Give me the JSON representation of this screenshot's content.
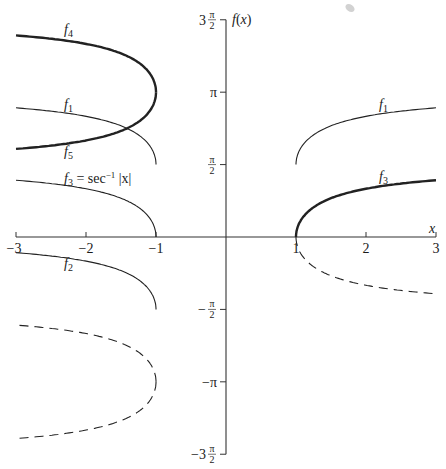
{
  "chart_data": {
    "type": "line",
    "title": "",
    "xlabel": "x",
    "ylabel": "f(x)",
    "xlim": [
      -3,
      3
    ],
    "ylim": [
      -4.712,
      4.712
    ],
    "grid": false,
    "x_ticks": [
      {
        "value": -3,
        "label": "−3"
      },
      {
        "value": -2,
        "label": "−2"
      },
      {
        "value": -1,
        "label": "−1"
      },
      {
        "value": 1,
        "label": "1"
      },
      {
        "value": 2,
        "label": "2"
      },
      {
        "value": 3,
        "label": "3"
      }
    ],
    "y_ticks": [
      {
        "value": 4.712,
        "label_pre": "3",
        "label_num": "π",
        "label_den": "2",
        "frac": true
      },
      {
        "value": 3.1416,
        "label_pre": "",
        "label_num": "π",
        "label_den": "",
        "frac": false
      },
      {
        "value": 1.5708,
        "label_pre": "",
        "label_num": "π",
        "label_den": "2",
        "frac": true
      },
      {
        "value": -1.5708,
        "label_pre": "−",
        "label_num": "π",
        "label_den": "2",
        "frac": true
      },
      {
        "value": -3.1416,
        "label_pre": "−",
        "label_num": "π",
        "label_den": "",
        "frac": false
      },
      {
        "value": -4.712,
        "label_pre": "−3",
        "label_num": "π",
        "label_den": "2",
        "frac": true
      }
    ],
    "series": [
      {
        "name": "f4",
        "label": "f4",
        "style": "thick",
        "description": "upper branch, x<-1: π + sec⁻¹|x|",
        "x": [
          -3,
          -2.5,
          -2,
          -1.5,
          -1.2,
          -1.05,
          -1
        ],
        "values": [
          4.37,
          4.3,
          4.19,
          3.98,
          3.73,
          3.45,
          3.14
        ]
      },
      {
        "name": "f5",
        "label": "f5",
        "style": "thick",
        "description": "lower branch, x<-1: π − sec⁻¹|x|",
        "x": [
          -3,
          -2.5,
          -2,
          -1.5,
          -1.2,
          -1.05,
          -1
        ],
        "values": [
          1.91,
          1.98,
          2.09,
          2.3,
          2.56,
          2.83,
          3.14
        ]
      },
      {
        "name": "f1",
        "label": "f1",
        "style": "thin",
        "description": "π/2 + sec⁻¹|x|",
        "x": [
          -3,
          -2.5,
          -2,
          -1.5,
          -1.2,
          -1.05,
          -1,
          1,
          1.05,
          1.2,
          1.5,
          2,
          2.5,
          3
        ],
        "values": [
          2.8,
          2.73,
          2.62,
          2.41,
          2.16,
          1.88,
          1.57,
          1.57,
          1.88,
          2.16,
          2.41,
          2.62,
          2.73,
          2.8
        ]
      },
      {
        "name": "f3",
        "label": "f3 = sec⁻¹ |x|",
        "style": "thin-left-thick-right",
        "description": "sec⁻¹|x|",
        "x": [
          -3,
          -2.5,
          -2,
          -1.5,
          -1.2,
          -1.05,
          -1,
          1,
          1.05,
          1.2,
          1.5,
          2,
          2.5,
          3
        ],
        "values": [
          1.23,
          1.16,
          1.05,
          0.84,
          0.59,
          0.31,
          0,
          0,
          0.31,
          0.59,
          0.84,
          1.05,
          1.16,
          1.23
        ]
      },
      {
        "name": "f2",
        "label": "f2",
        "style": "thin",
        "description": "sec⁻¹|x| − π/2, x<-1",
        "x": [
          -3,
          -2.5,
          -2,
          -1.5,
          -1.2,
          -1.05,
          -1
        ],
        "values": [
          -0.34,
          -0.41,
          -0.52,
          -0.73,
          -0.98,
          -1.26,
          -1.57
        ]
      },
      {
        "name": "dashed-left",
        "label": "",
        "style": "dashed",
        "description": "−π ± sec⁻¹|x|, x<-1",
        "x": [
          -3,
          -2.5,
          -2,
          -1.5,
          -1.2,
          -1.05,
          -1,
          -1.05,
          -1.2,
          -1.5,
          -2,
          -2.5,
          -3
        ],
        "values": [
          -1.91,
          -1.98,
          -2.09,
          -2.3,
          -2.56,
          -2.83,
          -3.14,
          -3.45,
          -3.73,
          -3.98,
          -4.19,
          -4.3,
          -4.37
        ]
      },
      {
        "name": "dashed-right",
        "label": "",
        "style": "dashed",
        "description": "−sec⁻¹|x|, x>1",
        "x": [
          1,
          1.05,
          1.2,
          1.5,
          2,
          2.5,
          3
        ],
        "values": [
          0,
          -0.31,
          -0.59,
          -0.84,
          -1.05,
          -1.16,
          -1.23
        ]
      }
    ],
    "annotations": [
      {
        "text": "f4",
        "x": -2.15,
        "y": 4.5
      },
      {
        "text": "f1",
        "x": -2.15,
        "y": 2.95
      },
      {
        "text": "f5",
        "x": -2.15,
        "y": 1.7
      },
      {
        "text": "f3 = sec⁻¹ |x|",
        "x": -2.15,
        "y": 1.38
      },
      {
        "text": "f2",
        "x": -2.15,
        "y": -0.58
      },
      {
        "text": "f1",
        "x": 2.55,
        "y": 2.95
      },
      {
        "text": "f3",
        "x": 2.55,
        "y": 1.38
      }
    ]
  },
  "labels": {
    "y_axis": "f(x)",
    "x_axis": "x",
    "f4": "f",
    "f4_sub": "4",
    "f1": "f",
    "f1_sub": "1",
    "f5": "f",
    "f5_sub": "5",
    "f3": "f",
    "f3_sub": "3",
    "f3_eq": " = sec",
    "f3_sup": "−1",
    "f3_arg": " |x|",
    "f2": "f",
    "f2_sub": "2"
  }
}
